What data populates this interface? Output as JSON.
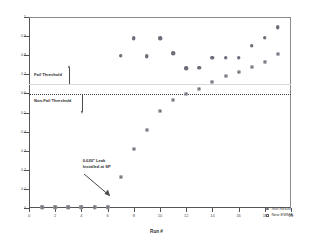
{
  "chart_data": {
    "type": "scatter",
    "title": "",
    "xlabel": "Run #",
    "ylabel": "%QD",
    "xlim": [
      0,
      20
    ],
    "ylim": [
      0,
      1
    ],
    "xticks": [
      0,
      2,
      4,
      6,
      8,
      10,
      12,
      14,
      16,
      18,
      20
    ],
    "xtick_labels": [
      "0",
      "2",
      "4",
      "6",
      "8",
      "10",
      "12",
      "14",
      "16",
      "18",
      "20"
    ],
    "yticks": [
      0,
      0.1,
      0.2,
      0.3,
      0.4,
      0.5,
      0.6,
      0.7,
      0.8,
      0.9,
      1
    ],
    "ytick_labels": [
      "0",
      "0.1",
      "0.2",
      "0.3",
      "0.4",
      "0.5",
      "0.6",
      "0.7",
      "0.8",
      "0.9",
      "1"
    ],
    "grid": false,
    "legend_position": "bottom-right",
    "series": [
      {
        "name": "Test Result",
        "marker": "circle",
        "color": "#6f6f7a",
        "x": [
          1,
          2,
          3,
          4,
          5,
          6,
          7,
          8,
          9,
          10,
          11,
          12,
          13,
          14,
          15,
          16,
          17,
          18,
          19
        ],
        "y": [
          0.004,
          0.004,
          0.004,
          0.004,
          0.004,
          0.004,
          0.798,
          0.889,
          0.795,
          0.888,
          0.812,
          0.733,
          0.735,
          0.787,
          0.787,
          0.787,
          0.849,
          0.892,
          0.947
        ]
      },
      {
        "name": "New EWMA",
        "marker": "square",
        "color": "#5f5f6a",
        "x": [
          1,
          2,
          3,
          4,
          5,
          6,
          7,
          8,
          9,
          10,
          11,
          12,
          13,
          14,
          15,
          16,
          17,
          18,
          19
        ],
        "y": [
          0.004,
          0.004,
          0.004,
          0.004,
          0.004,
          0.004,
          0.161,
          0.308,
          0.411,
          0.506,
          0.565,
          0.599,
          0.625,
          0.661,
          0.689,
          0.71,
          0.736,
          0.766,
          0.806
        ]
      }
    ],
    "threshold_lines": [
      {
        "name": "Fail Threshold",
        "value": 0.65,
        "style": "solid-light",
        "color": "#d8d8d8"
      },
      {
        "name": "Non-Fail Threshold",
        "value": 0.598,
        "style": "dotted",
        "color": "#3c3c3c"
      }
    ],
    "annotations": [
      {
        "name": "fail-threshold-label",
        "text": "Fail Threshold"
      },
      {
        "name": "nonfail-threshold-label",
        "text": "Non-Fail Threshold"
      },
      {
        "name": "leak-annotation",
        "line1": "0.020\" Leak",
        "line2": "Installed at SP"
      }
    ]
  },
  "legend": {
    "items": [
      {
        "label": "Test Result"
      },
      {
        "label": "New EWMA"
      }
    ]
  }
}
